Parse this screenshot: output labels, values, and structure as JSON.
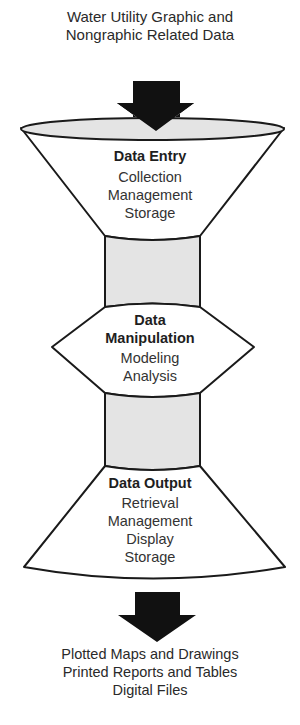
{
  "input": {
    "lines": [
      "Water Utility Graphic and",
      "Nongraphic Related Data"
    ]
  },
  "stages": [
    {
      "title": "Data Entry",
      "items": [
        "Collection",
        "Management",
        "Storage"
      ]
    },
    {
      "title_lines": [
        "Data",
        "Manipulation"
      ],
      "items": [
        "Modeling",
        "Analysis"
      ]
    },
    {
      "title": "Data Output",
      "items": [
        "Retrieval",
        "Management",
        "Display",
        "Storage"
      ]
    }
  ],
  "output": {
    "lines": [
      "Plotted Maps and Drawings",
      "Printed Reports and Tables",
      "Digital Files"
    ]
  },
  "colors": {
    "stroke": "#1a1a1a",
    "fill_gray": "#e4e4e4",
    "arrow": "#111111"
  }
}
